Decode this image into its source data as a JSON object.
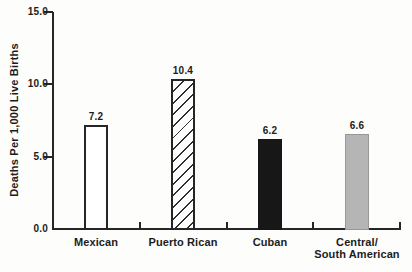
{
  "chart_data": {
    "type": "bar",
    "categories": [
      "Mexican",
      "Puerto Rican",
      "Cuban",
      "Central/\nSouth American"
    ],
    "values": [
      7.2,
      10.4,
      6.2,
      6.6
    ],
    "value_labels": [
      "7.2",
      "10.4",
      "6.2",
      "6.6"
    ],
    "title": "",
    "xlabel": "",
    "ylabel": "Deaths Per 1,000 Live Births",
    "ylim": [
      0,
      15
    ],
    "yticks": [
      0,
      5,
      10,
      15
    ],
    "ytick_labels": [
      "0.0",
      "5.0",
      "10.0",
      "15.0"
    ],
    "grid": false,
    "legend": "none",
    "bar_styles": [
      "outlined",
      "hatched",
      "solid-dark",
      "solid-gray"
    ],
    "colors": {
      "axis": "#262626",
      "text": "#1c1c1c",
      "bar_white": "#ffffff",
      "bar_black": "#171717",
      "bar_gray": "#b5b5b5",
      "background": "#fdfdfb"
    }
  }
}
